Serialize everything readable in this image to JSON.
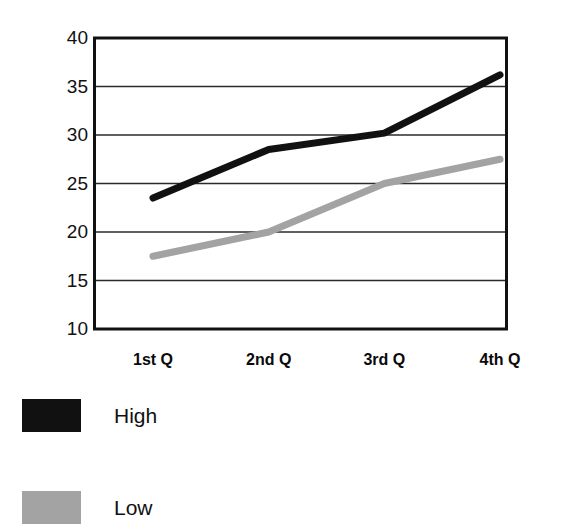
{
  "chart_data": {
    "type": "line",
    "title": "",
    "subtitle": "",
    "xlabel": "",
    "ylabel": "",
    "categories": [
      "1st Q",
      "2nd Q",
      "3rd Q",
      "4th Q"
    ],
    "series": [
      {
        "name": "High",
        "values": [
          23.5,
          28.5,
          30.2,
          36.2
        ],
        "color": "#111111"
      },
      {
        "name": "Low",
        "values": [
          17.5,
          20.0,
          25.0,
          27.5
        ],
        "color": "#a3a3a3"
      }
    ],
    "ylim": [
      10,
      40
    ],
    "yticks": [
      40,
      35,
      30,
      25,
      20,
      15,
      10
    ],
    "ytick_labels": [
      "40",
      "35",
      "30",
      "25",
      "20",
      "15",
      "10"
    ],
    "grid": true,
    "grid_axis": "y",
    "legend_position": "bottom-left",
    "frame": true,
    "markers": false,
    "line_width_high": 7,
    "line_width_low": 7
  },
  "axes": {
    "y_ticks": [
      {
        "label": "40",
        "value": 40
      },
      {
        "label": "35",
        "value": 35
      },
      {
        "label": "30",
        "value": 30
      },
      {
        "label": "25",
        "value": 25
      },
      {
        "label": "20",
        "value": 20
      },
      {
        "label": "15",
        "value": 15
      },
      {
        "label": "10",
        "value": 10
      }
    ],
    "x_ticks": [
      {
        "label": "1st Q"
      },
      {
        "label": "2nd Q"
      },
      {
        "label": "3rd Q"
      },
      {
        "label": "4th Q"
      }
    ]
  },
  "legend": {
    "items": [
      {
        "label": "High",
        "color": "#111111"
      },
      {
        "label": "Low",
        "color": "#a3a3a3"
      }
    ]
  },
  "colors": {
    "background": "#ffffff",
    "frame": "#111111",
    "gridline": "#2b2b2b",
    "series_high": "#111111",
    "series_low": "#a3a3a3",
    "text": "#111111"
  }
}
